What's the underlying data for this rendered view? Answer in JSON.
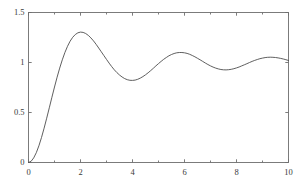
{
  "chart_data": {
    "type": "line",
    "title": "",
    "subtitle": "",
    "xlabel": "",
    "ylabel": "",
    "xlim": [
      0,
      10
    ],
    "ylim": [
      0,
      1.5
    ],
    "grid": false,
    "legend": null,
    "box": true,
    "line_color": "#4d4d4d",
    "axis_color": "#6e6e6e",
    "background": "#ffffff",
    "xticks": [
      0,
      2,
      4,
      6,
      8,
      10
    ],
    "xtick_labels": [
      "0",
      "2",
      "4",
      "6",
      "8",
      "10"
    ],
    "yticks": [
      0,
      0.5,
      1,
      1.5
    ],
    "ytick_labels": [
      "0",
      "0.5",
      "1",
      "1.5"
    ],
    "x_minor_ticks": [
      1,
      3,
      5,
      7,
      9
    ],
    "series": [
      {
        "name": "step response",
        "description": "Underdamped second-order step response settling to 1",
        "x": [
          0,
          0.1,
          0.2,
          0.3,
          0.4,
          0.5,
          0.6,
          0.7,
          0.8,
          0.9,
          1.0,
          1.1,
          1.2,
          1.3,
          1.4,
          1.5,
          1.6,
          1.7,
          1.8,
          1.9,
          2.0,
          2.1,
          2.2,
          2.3,
          2.4,
          2.5,
          2.6,
          2.7,
          2.8,
          2.9,
          3.0,
          3.1,
          3.2,
          3.3,
          3.4,
          3.5,
          3.6,
          3.7,
          3.8,
          3.9,
          4.0,
          4.1,
          4.2,
          4.3,
          4.4,
          4.5,
          4.6,
          4.7,
          4.8,
          4.9,
          5.0,
          5.1,
          5.2,
          5.3,
          5.4,
          5.5,
          5.6,
          5.7,
          5.8,
          5.9,
          6.0,
          6.1,
          6.2,
          6.3,
          6.4,
          6.5,
          6.6,
          6.7,
          6.8,
          6.9,
          7.0,
          7.1,
          7.2,
          7.3,
          7.4,
          7.5,
          7.6,
          7.7,
          7.8,
          7.9,
          8.0,
          8.1,
          8.2,
          8.3,
          8.4,
          8.5,
          8.6,
          8.7,
          8.8,
          8.9,
          9.0,
          9.1,
          9.2,
          9.3,
          9.4,
          9.5,
          9.6,
          9.7,
          9.8,
          9.9,
          10.0
        ],
        "y": [
          0.0,
          0.012,
          0.046,
          0.098,
          0.167,
          0.25,
          0.343,
          0.443,
          0.547,
          0.652,
          0.755,
          0.853,
          0.944,
          1.027,
          1.1,
          1.162,
          1.213,
          1.252,
          1.28,
          1.297,
          1.304,
          1.301,
          1.29,
          1.271,
          1.246,
          1.216,
          1.182,
          1.145,
          1.107,
          1.069,
          1.031,
          0.994,
          0.959,
          0.927,
          0.899,
          0.875,
          0.855,
          0.839,
          0.828,
          0.822,
          0.821,
          0.824,
          0.832,
          0.844,
          0.859,
          0.877,
          0.897,
          0.919,
          0.942,
          0.966,
          0.989,
          1.011,
          1.032,
          1.05,
          1.067,
          1.08,
          1.09,
          1.097,
          1.1,
          1.1,
          1.097,
          1.091,
          1.082,
          1.07,
          1.057,
          1.042,
          1.027,
          1.011,
          0.995,
          0.98,
          0.966,
          0.954,
          0.944,
          0.936,
          0.93,
          0.927,
          0.926,
          0.928,
          0.932,
          0.938,
          0.946,
          0.955,
          0.966,
          0.977,
          0.988,
          1.0,
          1.011,
          1.021,
          1.03,
          1.038,
          1.044,
          1.049,
          1.052,
          1.053,
          1.052,
          1.05,
          1.046,
          1.041,
          1.035,
          1.028,
          1.02
        ],
        "key_points": {
          "start": {
            "x": 0,
            "y": 0
          },
          "peaks": [
            {
              "x": 1.8,
              "y": 1.44
            },
            {
              "x": 4.0,
              "y": 1.21
            },
            {
              "x": 5.6,
              "y": 1.15
            },
            {
              "x": 7.1,
              "y": 1.11
            },
            {
              "x": 8.4,
              "y": 1.09
            },
            {
              "x": 9.6,
              "y": 1.08
            }
          ],
          "troughs": [
            {
              "x": 3.0,
              "y": 0.76
            },
            {
              "x": 4.8,
              "y": 0.86
            },
            {
              "x": 6.3,
              "y": 0.885
            },
            {
              "x": 7.7,
              "y": 0.905
            },
            {
              "x": 9.0,
              "y": 0.915
            }
          ],
          "end": {
            "x": 10,
            "y": 0.97
          },
          "steady_state": 1.0
        }
      }
    ]
  }
}
